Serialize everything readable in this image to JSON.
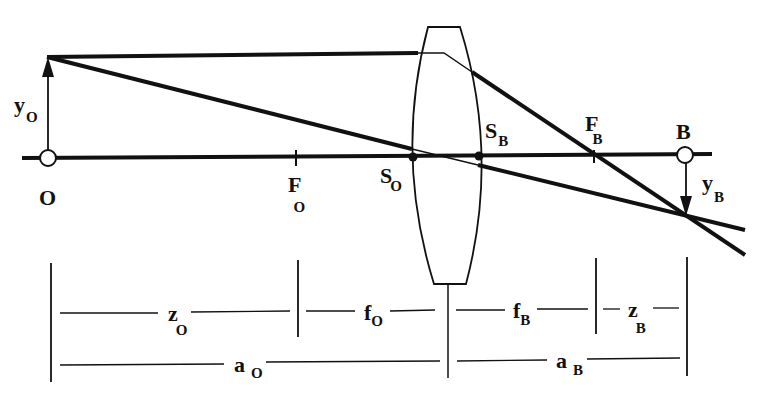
{
  "colors": {
    "ink": "#111111",
    "background": "#ffffff"
  },
  "labels": {
    "object_point": {
      "main": "O",
      "sub": ""
    },
    "object_height": {
      "main": "y",
      "sub": "O"
    },
    "object_focus": {
      "main": "F",
      "sub": "O"
    },
    "object_principal": {
      "main": "S",
      "sub": "O"
    },
    "image_principal": {
      "main": "S",
      "sub": "B"
    },
    "image_focus": {
      "main": "F",
      "sub": "B"
    },
    "image_point": {
      "main": "B",
      "sub": ""
    },
    "image_height": {
      "main": "y",
      "sub": "B"
    }
  },
  "dimensions": {
    "z_O": {
      "main": "z",
      "sub": "O"
    },
    "f_O": {
      "main": "f",
      "sub": "O"
    },
    "f_B": {
      "main": "f",
      "sub": "B"
    },
    "z_B": {
      "main": "z",
      "sub": "B"
    },
    "a_O": {
      "main": "a",
      "sub": "O"
    },
    "a_B": {
      "main": "a",
      "sub": "B"
    }
  }
}
